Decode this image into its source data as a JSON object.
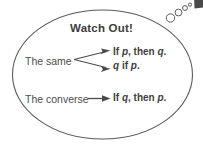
{
  "figure": {
    "kind": "watch-out-callout",
    "title": "Watch Out!",
    "shape": "ellipse",
    "outline_color": "#555555",
    "background_color": "#ffffff",
    "text_color": "#4d4d4d"
  },
  "rows": [
    {
      "label": "The same",
      "arrow": "fork-two-arrows",
      "statements": [
        "If p, then q.",
        "q if p."
      ]
    },
    {
      "label": "The converse",
      "arrow": "single-arrow",
      "statements": [
        "If q, then p."
      ]
    }
  ],
  "statements": {
    "if_p_then_q": {
      "a": "If ",
      "p": "p",
      "b": ", then ",
      "q": "q",
      "c": "."
    },
    "q_if_p": {
      "q": "q",
      "a": " if ",
      "p": "p",
      "b": "."
    },
    "if_q_then_p": {
      "a": "If ",
      "q": "q",
      "b": ", then ",
      "p": "p",
      "c": "."
    }
  },
  "labels": {
    "the_same": "The same",
    "the_converse": "The converse"
  },
  "bubble_tail": {
    "name": "thought-bubble-tail",
    "circles": [
      {
        "cx": 170.5,
        "cy": 18.0,
        "r": 4.2
      },
      {
        "cx": 178.5,
        "cy": 12.5,
        "r": 3.4
      },
      {
        "cx": 185.0,
        "cy": 8.0,
        "r": 2.4
      },
      {
        "cx": 190.0,
        "cy": 4.6,
        "r": 1.6
      }
    ],
    "marker": {
      "x": 193,
      "y": 0,
      "w": 10,
      "h": 9
    }
  }
}
